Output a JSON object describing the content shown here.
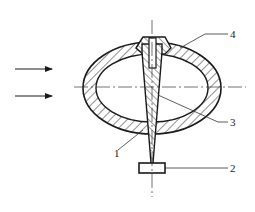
{
  "diagram": {
    "type": "mechanical cross-section",
    "labels": [
      {
        "id": "1",
        "text": "1",
        "x": 117,
        "y": 156
      },
      {
        "id": "2",
        "text": "2",
        "x": 232,
        "y": 172
      },
      {
        "id": "3",
        "text": "3",
        "x": 232,
        "y": 126
      },
      {
        "id": "4",
        "text": "4",
        "x": 232,
        "y": 38
      }
    ],
    "flow_arrows": 2,
    "colors": {
      "line": "#1a1a1a",
      "background": "#ffffff"
    }
  }
}
